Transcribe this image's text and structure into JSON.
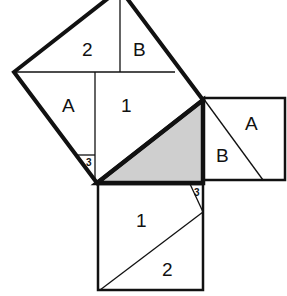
{
  "diagram": {
    "colors": {
      "stroke": "#111111",
      "triangle_fill": "#cfcfcf",
      "background": "#ffffff"
    },
    "pieces": {
      "hypotenuse_square": [
        "2",
        "B",
        "A",
        "1",
        "3"
      ],
      "leg_square_small": [
        "A",
        "B"
      ],
      "leg_square_large": [
        "1",
        "2",
        "3"
      ]
    },
    "labels": {
      "hyp_2": "2",
      "hyp_B": "B",
      "hyp_A": "A",
      "hyp_1": "1",
      "hyp_3": "3",
      "small_A": "A",
      "small_B": "B",
      "large_1": "1",
      "large_2": "2",
      "large_3": "3"
    }
  }
}
